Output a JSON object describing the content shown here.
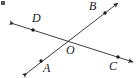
{
  "figure": {
    "background_color": "#ffffff",
    "stroke_color": "#2a2a2a",
    "label_color": "#1c1c1c",
    "labels": {
      "A": "A",
      "B": "B",
      "C": "C",
      "D": "D",
      "O": "O"
    },
    "artifact": {
      "name": "corner-smudge",
      "visible": true
    }
  },
  "geometry": {
    "intersection": {
      "name": "O",
      "x": 68,
      "y": 41
    },
    "lines": [
      {
        "name": "line-AB",
        "from_label": "A",
        "to_label": "B",
        "x1": 27,
        "y1": 73,
        "x2": 118,
        "y2": 3,
        "arrow_start": true,
        "arrow_end": true,
        "points": [
          {
            "label": "A",
            "x": 41,
            "y": 61
          },
          {
            "label": "B",
            "x": 105,
            "y": 13
          }
        ]
      },
      {
        "name": "line-DC",
        "from_label": "D",
        "to_label": "C",
        "x1": 14,
        "y1": 24,
        "x2": 133,
        "y2": 62,
        "arrow_start": true,
        "arrow_end": true,
        "points": [
          {
            "label": "D",
            "x": 33,
            "y": 30
          },
          {
            "label": "C",
            "x": 118,
            "y": 57
          }
        ]
      }
    ]
  }
}
